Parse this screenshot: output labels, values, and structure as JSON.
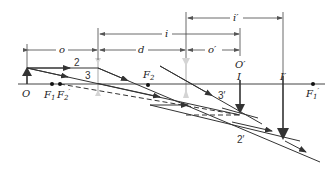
{
  "diagram": {
    "colors": {
      "line": "#333333",
      "lens": "#cccccc",
      "background": "#ffffff"
    },
    "dimensions": {
      "o": "o",
      "d": "d",
      "i": "i",
      "o_prime": "o′",
      "i_prime": "i′"
    },
    "points": {
      "object": "O",
      "F1": "F",
      "F1_sub": "1",
      "F2_prime": "F",
      "F2_prime_sub": "2",
      "F2_prime_mark": "′",
      "F2": "F",
      "F2_sub": "2",
      "O_prime": "O′",
      "I": "I",
      "I_prime": "I′",
      "F1_prime": "F",
      "F1_prime_sub": "1",
      "F1_prime_mark": "′"
    },
    "rays": {
      "ray2": "2",
      "ray3": "3",
      "ray3_prime": "3′",
      "ray2_prime": "2′"
    }
  }
}
